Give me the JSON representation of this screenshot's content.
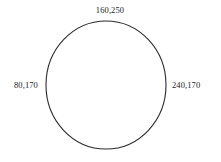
{
  "figure": {
    "type": "circle-diagram",
    "background_color": "#ffffff",
    "stroke_color": "#2b2b2b",
    "text_color": "#1d1d1d",
    "labels": {
      "top": "160,250",
      "left": "80,170",
      "right": "240,170"
    },
    "shape": {
      "name": "circle-outline",
      "center_x": 106,
      "center_y": 85,
      "radius_x": 60,
      "radius_y": 64,
      "stroke_width": 1
    }
  }
}
